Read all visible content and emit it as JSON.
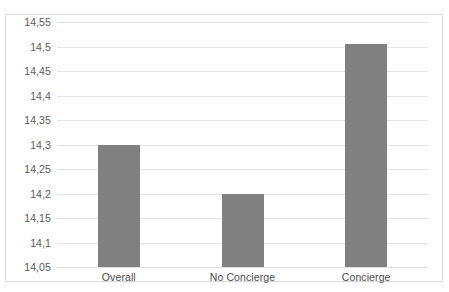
{
  "chart_data": {
    "type": "bar",
    "title": "",
    "subtitle": "",
    "xlabel": "",
    "ylabel": "",
    "categories": [
      "Overall",
      "No Concierge",
      "Concierge"
    ],
    "values": [
      14.3,
      14.2,
      14.505
    ],
    "value_labels": [
      "14,3",
      "14,2",
      "14,505"
    ],
    "ylim": [
      14.05,
      14.55
    ],
    "ytick_labels": [
      "14,55",
      "14,5",
      "14,45",
      "14,4",
      "14,35",
      "14,3",
      "14,25",
      "14,2",
      "14,15",
      "14,1",
      "14,05"
    ],
    "ytick_values": [
      14.55,
      14.5,
      14.45,
      14.4,
      14.35,
      14.3,
      14.25,
      14.2,
      14.15,
      14.1,
      14.05
    ],
    "grid": true,
    "legend": "none",
    "decimal_separator": ",",
    "series": [
      {
        "name": "",
        "values": [
          14.3,
          14.2,
          14.505
        ]
      }
    ],
    "colors": {
      "bar": "#808080",
      "gridline": "#e4e4e4",
      "frame": "#d9d9d9",
      "plot_background": "#ffffff",
      "tick_label": "#595959",
      "category_label": "#4d4d4d"
    }
  }
}
